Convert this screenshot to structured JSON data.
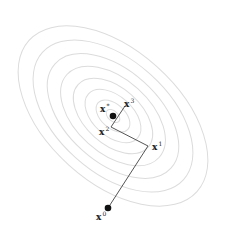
{
  "diagram": {
    "title": "",
    "contours": {
      "center": [
        113,
        116
      ],
      "rotation_deg": 42,
      "count": 8,
      "color": "#dcdcdc",
      "radii": [
        [
          8,
          5
        ],
        [
          20,
          12
        ],
        [
          33,
          20
        ],
        [
          47,
          28
        ],
        [
          62,
          37
        ],
        [
          78,
          46
        ],
        [
          95,
          56
        ],
        [
          113,
          66
        ]
      ]
    },
    "path": {
      "color": "#555555",
      "points": [
        {
          "id": "x0",
          "x": 108,
          "y": 208
        },
        {
          "id": "x1",
          "x": 148,
          "y": 146
        },
        {
          "id": "x2",
          "x": 111,
          "y": 127
        },
        {
          "id": "x3",
          "x": 125,
          "y": 106
        }
      ]
    },
    "optimum": {
      "x": 113,
      "y": 116
    },
    "labels": [
      {
        "id": "xstar",
        "base": "x",
        "sup": "*",
        "x": 100,
        "y": 103
      },
      {
        "id": "x3",
        "base": "x",
        "sup": "3",
        "x": 124,
        "y": 98
      },
      {
        "id": "x2",
        "base": "x",
        "sup": "2",
        "x": 99,
        "y": 126
      },
      {
        "id": "x1",
        "base": "x",
        "sup": "1",
        "x": 152,
        "y": 141
      },
      {
        "id": "x0",
        "base": "x",
        "sup": "0",
        "x": 96,
        "y": 211
      }
    ]
  }
}
